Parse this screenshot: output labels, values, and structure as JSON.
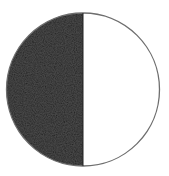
{
  "figure": {
    "shape": "circle",
    "center": [
      83,
      89.5
    ],
    "radius": 76.5,
    "split_x": 83,
    "halves": [
      {
        "side": "left",
        "fill": "#232323",
        "shaded": true
      },
      {
        "side": "right",
        "fill": "#ffffff",
        "shaded": false
      }
    ],
    "outline_color": "#6e6e6e",
    "background": "#ffffff"
  }
}
